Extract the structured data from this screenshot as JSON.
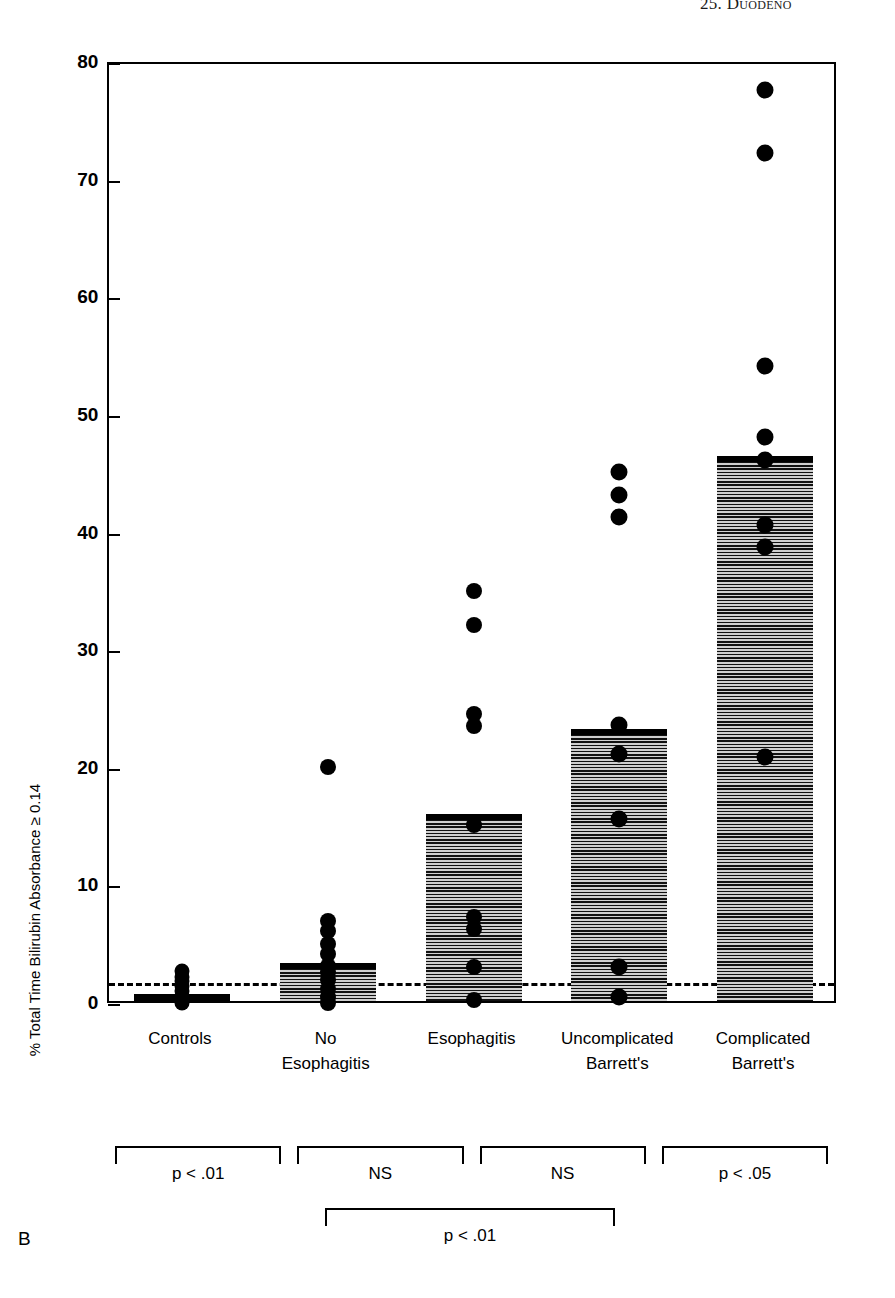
{
  "header": {
    "running_head": "25. Duodeno"
  },
  "panel_letter": "B",
  "chart_data": {
    "type": "bar",
    "title": "",
    "xlabel": "",
    "ylabel": "% Total Time Bilirubin Absorbance ≥ 0.14",
    "ylim": [
      0,
      80
    ],
    "yticks": [
      0,
      10,
      20,
      30,
      40,
      50,
      60,
      70,
      80
    ],
    "ytick_labels": [
      "0",
      "10",
      "20",
      "30",
      "40",
      "50",
      "60",
      "70",
      "80"
    ],
    "grid": false,
    "legend": "none",
    "threshold_line": {
      "value": 1.8,
      "style": "dashed",
      "label": ""
    },
    "categories": [
      "Controls",
      "No Esophagitis",
      "Esophagitis",
      "Uncomplicated Barrett's",
      "Complicated Barrett's"
    ],
    "values": [
      0.5,
      3.2,
      15.9,
      23.1,
      46.3
    ],
    "series": [
      {
        "name": "Median % total time",
        "values": [
          0.5,
          3.2,
          15.9,
          23.1,
          46.3
        ]
      }
    ],
    "scatter_overlay": [
      {
        "category": "Controls",
        "points": [
          0.2,
          0.4,
          0.8,
          1.2,
          1.6,
          2.0,
          2.4,
          2.9
        ]
      },
      {
        "category": "No Esophagitis",
        "points": [
          0.2,
          0.7,
          1.4,
          2.1,
          2.8,
          3.3,
          4.3,
          5.2,
          6.3,
          7.1,
          20.2
        ]
      },
      {
        "category": "Esophagitis",
        "points": [
          0.4,
          3.2,
          6.5,
          7.5,
          15.3,
          23.7,
          24.7,
          32.3,
          35.2
        ]
      },
      {
        "category": "Uncomplicated Barrett's",
        "points": [
          0.7,
          3.2,
          15.8,
          21.3,
          23.8,
          41.5,
          43.4,
          45.3
        ]
      },
      {
        "category": "Complicated Barrett's",
        "points": [
          21.1,
          38.9,
          40.8,
          46.3,
          48.3,
          54.3,
          72.4,
          77.8
        ]
      }
    ],
    "significance_brackets": [
      {
        "label": "p < .01",
        "from": "Controls",
        "to": "No Esophagitis",
        "row": 1
      },
      {
        "label": "NS",
        "from": "No Esophagitis",
        "to": "Esophagitis",
        "row": 1
      },
      {
        "label": "NS",
        "from": "Esophagitis",
        "to": "Uncomplicated Barrett's",
        "row": 1
      },
      {
        "label": "p < .05",
        "from": "Uncomplicated Barrett's",
        "to": "Complicated Barrett's",
        "row": 1
      },
      {
        "label": "p < .01",
        "from": "No Esophagitis",
        "to": "Uncomplicated Barrett's",
        "row": 2
      }
    ],
    "colors": {
      "bar_fill": "#bdbdbd",
      "bar_cap": "#000000",
      "dot": "#000000",
      "axis": "#000000"
    }
  }
}
